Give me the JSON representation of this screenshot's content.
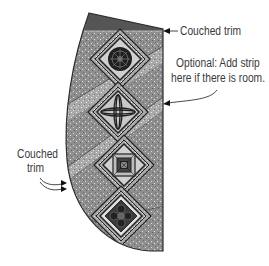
{
  "figure": {
    "colors": {
      "background": "#ffffff",
      "fabric_mid": "#8c8c8c",
      "fabric_light": "#b3b3b3",
      "top_band": "#555555",
      "outline": "#2a2a2a",
      "label_text": "#3a3a3a"
    },
    "blocks": [
      {
        "name": "medallion-block",
        "motif": "circular rosette"
      },
      {
        "name": "cross-block",
        "motif": "four-petal cross"
      },
      {
        "name": "log-cabin-block",
        "motif": "concentric squares"
      },
      {
        "name": "flower-block",
        "motif": "quatrefoil flower"
      }
    ]
  },
  "labels": {
    "couched_trim_top": "Couched trim",
    "optional_strip_line1": "Optional: Add strip",
    "optional_strip_line2": "here if there is room.",
    "couched_trim_left_line1": "Couched",
    "couched_trim_left_line2": "trim"
  }
}
